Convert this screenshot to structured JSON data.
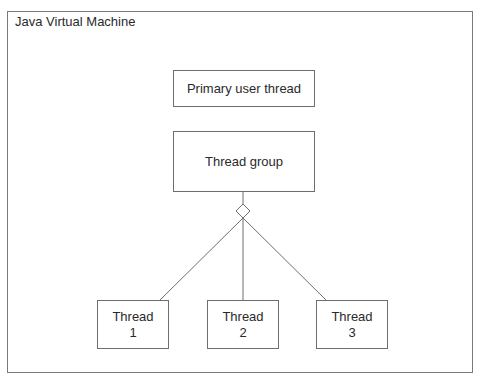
{
  "diagram": {
    "container_label": "Java Virtual Machine",
    "primary_thread": "Primary user thread",
    "thread_group": "Thread group",
    "threads": [
      {
        "line1": "Thread",
        "line2": "1"
      },
      {
        "line1": "Thread",
        "line2": "2"
      },
      {
        "line1": "Thread",
        "line2": "3"
      }
    ],
    "aggregation_symbol": "diamond-icon",
    "colors": {
      "border": "#6e6e6e",
      "text": "#2a2a2a",
      "background": "#ffffff"
    }
  }
}
